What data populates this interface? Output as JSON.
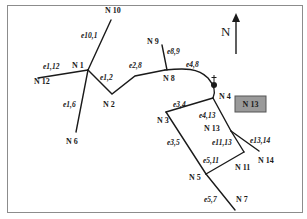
{
  "diagram": {
    "type": "network-graph",
    "colors": {
      "line": "#1a1a1a",
      "frame": "#8c8c8c",
      "highlight_box": "#9a9a9a"
    },
    "north_arrow": {
      "label": "N"
    },
    "highlight_box": {
      "label": "N 13"
    },
    "landmark": {
      "icon": "church-icon"
    },
    "nodes": [
      {
        "id": "N1",
        "label": "N 1"
      },
      {
        "id": "N2",
        "label": "N 2"
      },
      {
        "id": "N3",
        "label": "N 3"
      },
      {
        "id": "N4",
        "label": "N 4"
      },
      {
        "id": "N5",
        "label": "N 5"
      },
      {
        "id": "N6",
        "label": "N 6"
      },
      {
        "id": "N7",
        "label": "N 7"
      },
      {
        "id": "N8",
        "label": "N 8"
      },
      {
        "id": "N9",
        "label": "N 9"
      },
      {
        "id": "N10",
        "label": "N 10"
      },
      {
        "id": "N11",
        "label": "N 11"
      },
      {
        "id": "N12",
        "label": "N 12"
      },
      {
        "id": "N13",
        "label": "N 13"
      },
      {
        "id": "N14",
        "label": "N 14"
      }
    ],
    "edges": [
      {
        "id": "e10_1",
        "label": "e10,1",
        "from": "N10",
        "to": "N1"
      },
      {
        "id": "e1_12",
        "label": "e1,12",
        "from": "N1",
        "to": "N12"
      },
      {
        "id": "e1_2",
        "label": "e1,2",
        "from": "N1",
        "to": "N2"
      },
      {
        "id": "e1_6",
        "label": "e1,6",
        "from": "N1",
        "to": "N6"
      },
      {
        "id": "e2_8",
        "label": "e2,8",
        "from": "N2",
        "to": "N8"
      },
      {
        "id": "e8_9",
        "label": "e8,9",
        "from": "N8",
        "to": "N9"
      },
      {
        "id": "e4_8",
        "label": "e4,8",
        "from": "N8",
        "to": "N4"
      },
      {
        "id": "e3_4",
        "label": "e3,4",
        "from": "N3",
        "to": "N4"
      },
      {
        "id": "e4_13",
        "label": "e4,13",
        "from": "N4",
        "to": "N13"
      },
      {
        "id": "e13_14",
        "label": "e13,14",
        "from": "N13",
        "to": "N14"
      },
      {
        "id": "e11_13",
        "label": "e11,13",
        "from": "N13",
        "to": "N11"
      },
      {
        "id": "e3_5",
        "label": "e3,5",
        "from": "N3",
        "to": "N5"
      },
      {
        "id": "e5_11",
        "label": "e5,11",
        "from": "N5",
        "to": "N11"
      },
      {
        "id": "e5_7",
        "label": "e5,7",
        "from": "N5",
        "to": "N7"
      }
    ]
  }
}
